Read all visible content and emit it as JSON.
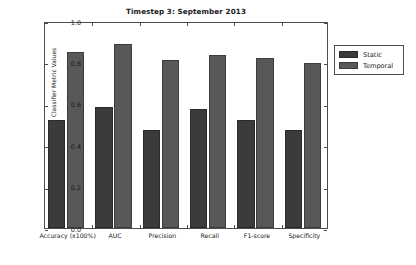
{
  "chart_data": {
    "type": "bar",
    "title": "Timestep 3: September 2013",
    "xlabel": "",
    "ylabel": "Classifier Metric Values",
    "categories": [
      "Accuracy (x100%)",
      "AUC",
      "Precision",
      "Recall",
      "F1-score",
      "Specificity"
    ],
    "series": [
      {
        "name": "Static",
        "values": [
          0.52,
          0.585,
          0.475,
          0.575,
          0.52,
          0.475
        ],
        "color": "#3b3b3b"
      },
      {
        "name": "Temporal",
        "values": [
          0.85,
          0.89,
          0.81,
          0.835,
          0.82,
          0.795
        ],
        "color": "#585858"
      }
    ],
    "ylim": [
      0.0,
      1.0
    ],
    "yticks": [
      "0.0",
      "0.2",
      "0.4",
      "0.6",
      "0.8",
      "1.0"
    ],
    "ytick_values": [
      0.0,
      0.2,
      0.4,
      0.6,
      0.8,
      1.0
    ],
    "grid": false,
    "legend_position": "outside-upper-right"
  },
  "legend": {
    "entries": [
      {
        "label": "Static"
      },
      {
        "label": "Temporal"
      }
    ]
  }
}
